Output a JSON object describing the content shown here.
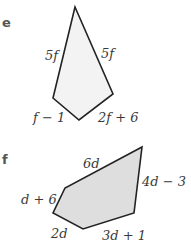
{
  "parts": [
    {
      "id": "e",
      "label": "e",
      "shape": "quadrilateral (kite-like)",
      "fill": "#f3f3f3",
      "stroke": "#222222",
      "vertices": [
        [
          75,
          7
        ],
        [
          113,
          94
        ],
        [
          79,
          120
        ],
        [
          53,
          98
        ]
      ],
      "sides": [
        {
          "label": "5f",
          "position": "upper-left"
        },
        {
          "label": "5f",
          "position": "upper-right"
        },
        {
          "label": "f − 1",
          "position": "lower-left"
        },
        {
          "label": "2f + 6",
          "position": "lower-right"
        }
      ]
    },
    {
      "id": "f",
      "label": "f",
      "shape": "pentagon",
      "fill": "#dedede",
      "stroke": "#222222",
      "vertices": [
        [
          142,
          147
        ],
        [
          134,
          213
        ],
        [
          83,
          229
        ],
        [
          53,
          213
        ],
        [
          65,
          188
        ]
      ],
      "sides": [
        {
          "label": "6d",
          "position": "top"
        },
        {
          "label": "4d − 3",
          "position": "right"
        },
        {
          "label": "3d + 1",
          "position": "bottom-right"
        },
        {
          "label": "2d",
          "position": "bottom-left"
        },
        {
          "label": "d + 6",
          "position": "left"
        }
      ]
    }
  ]
}
